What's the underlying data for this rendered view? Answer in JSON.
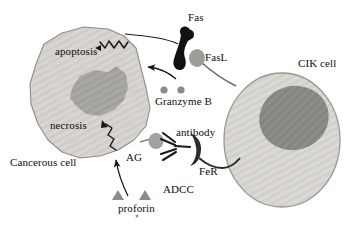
{
  "figure": {
    "type": "biological-diagram",
    "background_color": "#ffffff",
    "text_color": "#0d0d0d"
  },
  "labels": {
    "apoptosis": "apoptosis",
    "necrosis": "necrosis",
    "cancerous_cell": "Cancerous cell",
    "fas": "Fas",
    "fasl": "FasL",
    "granzyme_b": "Granzyme B",
    "antibody": "antibody",
    "ag": "AG",
    "fer": "FeR",
    "adcc": "ADCC",
    "proforin": "proforin",
    "cik_cell": "CIK cell"
  },
  "cells": {
    "cancerous_cell": {
      "name": "Cancerous cell",
      "cytoplasm_color": "#d9d6d1",
      "nucleus_color": "#aaa8a4",
      "outline_color": "#8f8d89"
    },
    "cik_cell": {
      "name": "CIK cell",
      "cytoplasm_color": "#d9d7d2",
      "nucleus_color": "#8e8c88",
      "outline_color": "#9a9894"
    }
  },
  "molecules": {
    "fas": {
      "label": "Fas",
      "color": "#111111",
      "shape": "dark-hook"
    },
    "fasl": {
      "label": "FasL",
      "color": "#9e9c98",
      "shape": "stalked-blob"
    },
    "granzyme_b": {
      "label": "Granzyme B",
      "color": "#8c8a86",
      "shape": "small-dots",
      "count": 2
    },
    "antibody": {
      "label": "antibody",
      "color": "#1a1a1a",
      "shape": "y-shape"
    },
    "ag": {
      "label": "AG",
      "color": "#a3a19d",
      "shape": "stalked-blob"
    },
    "fer": {
      "label": "FeR",
      "color": "#2b2b2b",
      "shape": "crescent"
    },
    "proforin": {
      "label": "proforin",
      "color": "#8e8c88",
      "shape": "triangles",
      "count": 2
    }
  },
  "processes": {
    "apoptosis": {
      "label": "apoptosis",
      "arrow": "zigzag-left"
    },
    "necrosis": {
      "label": "necrosis",
      "arrow": "zigzag-up-left"
    },
    "adcc": {
      "label": "ADCC"
    }
  }
}
